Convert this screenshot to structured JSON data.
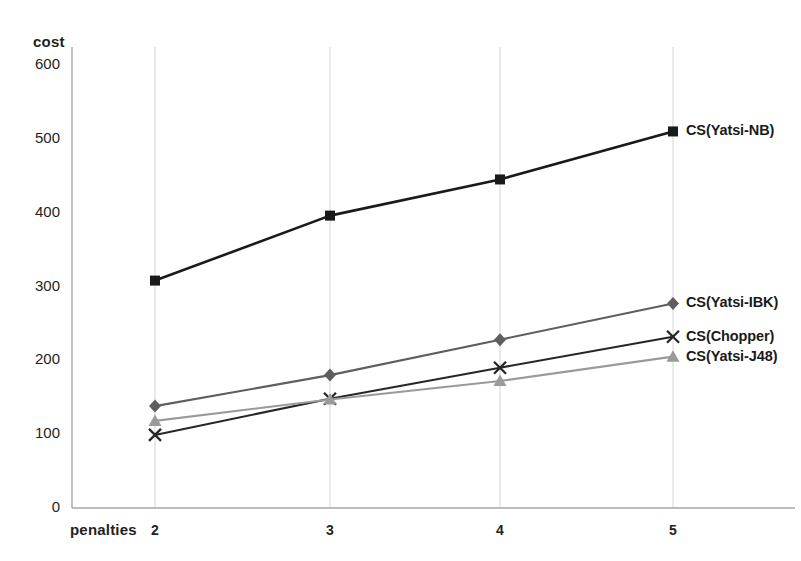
{
  "chart_data": {
    "type": "line",
    "title": "",
    "subtitle": "",
    "xlabel": "penalties",
    "ylabel": "cost",
    "categories": [
      "2",
      "3",
      "4",
      "5"
    ],
    "x": [
      2,
      3,
      4,
      5
    ],
    "xlim": [
      1.5,
      5.6
    ],
    "ylim": [
      0,
      600
    ],
    "yticks": [
      "0",
      "100",
      "200",
      "300",
      "400",
      "500",
      "600"
    ],
    "ytick_values": [
      0,
      100,
      200,
      300,
      400,
      500,
      600
    ],
    "grid": "vertical-only",
    "legend_position": "right-inline-at-line-end",
    "series": [
      {
        "name": "CS(Yatsi-NB)",
        "marker": "square",
        "color": "#1a1a1a",
        "values": [
          308,
          396,
          445,
          510
        ]
      },
      {
        "name": "CS(Yatsi-IBK)",
        "marker": "diamond",
        "color": "#5e5e5e",
        "values": [
          138,
          180,
          228,
          277
        ]
      },
      {
        "name": "CS(Chopper)",
        "marker": "x",
        "color": "#262626",
        "values": [
          99,
          148,
          190,
          232
        ]
      },
      {
        "name": "CS(Yatsi-J48)",
        "marker": "triangle",
        "color": "#9a9a9a",
        "values": [
          118,
          147,
          172,
          205
        ]
      }
    ]
  },
  "axes": {
    "y_title": "cost",
    "x_title": "penalties"
  },
  "colors": {
    "axis": "#a6a6a6",
    "grid": "#d9d9d9",
    "text": "#231f20",
    "background": "#ffffff"
  }
}
